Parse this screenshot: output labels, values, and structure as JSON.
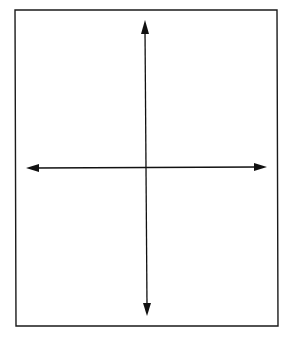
{
  "diagram": {
    "type": "coordinate-plane-axes",
    "colors": {
      "background": "#ffffff",
      "frame": "#1a1a1a",
      "axis": "#111111"
    },
    "frame": {
      "x1": 15,
      "y1": 10,
      "x2": 277,
      "y2": 10,
      "x3": 278,
      "y3": 326,
      "x4": 16,
      "y4": 326
    },
    "horizontal_axis": {
      "start": [
        26,
        168
      ],
      "end": [
        267,
        167
      ],
      "arrowheads": [
        "left",
        "right"
      ]
    },
    "vertical_axis": {
      "start": [
        145,
        20
      ],
      "end": [
        147,
        316
      ],
      "arrowheads": [
        "up",
        "down"
      ]
    },
    "origin": [
      146,
      167
    ],
    "labels": []
  }
}
